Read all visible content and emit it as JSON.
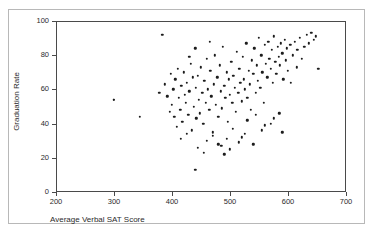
{
  "top_fragment": "",
  "chart_data": {
    "type": "scatter",
    "title": "",
    "xlabel": "Average Verbal SAT Score",
    "ylabel": "Graduation Rate",
    "xlim": [
      200,
      700
    ],
    "ylim": [
      0,
      100
    ],
    "xticks": [
      200,
      300,
      400,
      500,
      600,
      700
    ],
    "yticks": [
      0,
      20,
      40,
      60,
      80,
      100
    ],
    "grid": false,
    "legend": null,
    "marker": {
      "shape": "circle",
      "color": "#1c1c1c",
      "size": 2.4
    },
    "series": [
      {
        "name": "Colleges",
        "points": [
          [
            300,
            54
          ],
          [
            345,
            44
          ],
          [
            378,
            58
          ],
          [
            383,
            92
          ],
          [
            388,
            63
          ],
          [
            392,
            56
          ],
          [
            396,
            47
          ],
          [
            398,
            69
          ],
          [
            400,
            51
          ],
          [
            402,
            60
          ],
          [
            404,
            44
          ],
          [
            406,
            66
          ],
          [
            408,
            38
          ],
          [
            410,
            72
          ],
          [
            412,
            55
          ],
          [
            414,
            48
          ],
          [
            416,
            62
          ],
          [
            418,
            41
          ],
          [
            420,
            70
          ],
          [
            422,
            57
          ],
          [
            424,
            52
          ],
          [
            426,
            64
          ],
          [
            428,
            45
          ],
          [
            430,
            59
          ],
          [
            432,
            75
          ],
          [
            434,
            36
          ],
          [
            436,
            67
          ],
          [
            438,
            50
          ],
          [
            440,
            13
          ],
          [
            441,
            61
          ],
          [
            442,
            43
          ],
          [
            444,
            68
          ],
          [
            446,
            54
          ],
          [
            448,
            46
          ],
          [
            450,
            73
          ],
          [
            452,
            58
          ],
          [
            454,
            40
          ],
          [
            456,
            65
          ],
          [
            458,
            52
          ],
          [
            460,
            78
          ],
          [
            462,
            60
          ],
          [
            464,
            48
          ],
          [
            466,
            71
          ],
          [
            468,
            56
          ],
          [
            470,
            35
          ],
          [
            472,
            63
          ],
          [
            474,
            80
          ],
          [
            476,
            51
          ],
          [
            478,
            67
          ],
          [
            480,
            44
          ],
          [
            482,
            74
          ],
          [
            484,
            59
          ],
          [
            486,
            49
          ],
          [
            488,
            85
          ],
          [
            490,
            62
          ],
          [
            492,
            55
          ],
          [
            494,
            70
          ],
          [
            496,
            41
          ],
          [
            498,
            66
          ],
          [
            500,
            57
          ],
          [
            502,
            76
          ],
          [
            504,
            52
          ],
          [
            506,
            68
          ],
          [
            508,
            61
          ],
          [
            510,
            47
          ],
          [
            512,
            82
          ],
          [
            514,
            58
          ],
          [
            516,
            72
          ],
          [
            518,
            64
          ],
          [
            520,
            53
          ],
          [
            522,
            79
          ],
          [
            524,
            66
          ],
          [
            526,
            60
          ],
          [
            528,
            87
          ],
          [
            530,
            55
          ],
          [
            532,
            71
          ],
          [
            534,
            63
          ],
          [
            536,
            48
          ],
          [
            538,
            77
          ],
          [
            540,
            69
          ],
          [
            542,
            84
          ],
          [
            544,
            58
          ],
          [
            546,
            74
          ],
          [
            548,
            65
          ],
          [
            550,
            90
          ],
          [
            552,
            61
          ],
          [
            554,
            80
          ],
          [
            556,
            70
          ],
          [
            558,
            52
          ],
          [
            560,
            86
          ],
          [
            562,
            75
          ],
          [
            564,
            67
          ],
          [
            566,
            88
          ],
          [
            568,
            78
          ],
          [
            570,
            72
          ],
          [
            572,
            83
          ],
          [
            574,
            64
          ],
          [
            576,
            91
          ],
          [
            578,
            76
          ],
          [
            580,
            69
          ],
          [
            582,
            85
          ],
          [
            584,
            79
          ],
          [
            586,
            74
          ],
          [
            588,
            87
          ],
          [
            590,
            81
          ],
          [
            592,
            66
          ],
          [
            594,
            89
          ],
          [
            596,
            77
          ],
          [
            598,
            84
          ],
          [
            600,
            71
          ],
          [
            604,
            86
          ],
          [
            608,
            80
          ],
          [
            612,
            88
          ],
          [
            616,
            83
          ],
          [
            620,
            90
          ],
          [
            624,
            78
          ],
          [
            628,
            85
          ],
          [
            632,
            92
          ],
          [
            636,
            87
          ],
          [
            640,
            93
          ],
          [
            644,
            89
          ],
          [
            648,
            91
          ],
          [
            652,
            72
          ],
          [
            460,
            30
          ],
          [
            470,
            33
          ],
          [
            480,
            28
          ],
          [
            495,
            31
          ],
          [
            505,
            37
          ],
          [
            515,
            29
          ],
          [
            525,
            34
          ],
          [
            445,
            26
          ],
          [
            455,
            23
          ],
          [
            490,
            22
          ],
          [
            530,
            42
          ],
          [
            545,
            45
          ],
          [
            560,
            39
          ],
          [
            575,
            43
          ],
          [
            590,
            35
          ],
          [
            430,
            79
          ],
          [
            440,
            84
          ],
          [
            415,
            31
          ],
          [
            425,
            34
          ],
          [
            465,
            88
          ],
          [
            485,
            27
          ],
          [
            500,
            25
          ],
          [
            520,
            32
          ],
          [
            540,
            28
          ],
          [
            555,
            36
          ],
          [
            570,
            40
          ],
          [
            585,
            46
          ],
          [
            605,
            64
          ],
          [
            615,
            73
          ],
          [
            300,
            54
          ]
        ]
      }
    ]
  }
}
